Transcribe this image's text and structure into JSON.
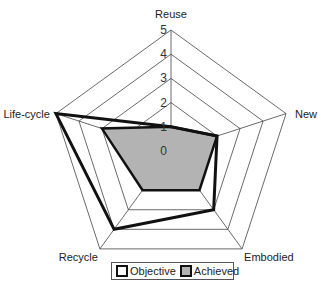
{
  "chart_data": {
    "type": "radar",
    "title": "",
    "axes": [
      "Reuse",
      "New",
      "Embodied",
      "Recycle",
      "Life-cycle"
    ],
    "rlim": [
      0,
      5
    ],
    "ticks": [
      "0",
      "1",
      "2",
      "3",
      "4",
      "5"
    ],
    "grid": true,
    "legend_position": "bottom",
    "series": [
      {
        "name": "Objective",
        "values": [
          1,
          2,
          3,
          4,
          5
        ],
        "fill": "none",
        "stroke": "#111111"
      },
      {
        "name": "Achieved",
        "values": [
          1,
          2,
          2,
          2,
          3
        ],
        "fill": "#b3b3b3",
        "stroke": "#111111"
      }
    ]
  },
  "legend": {
    "objective_label": "Objective",
    "achieved_label": "Achieved",
    "objective_color": "#ffffff",
    "achieved_color": "#b3b3b3"
  }
}
